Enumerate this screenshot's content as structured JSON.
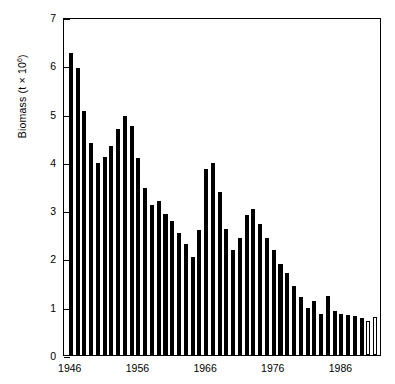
{
  "chart_data": {
    "type": "bar",
    "title": "",
    "subtitle": "",
    "xlabel": "",
    "ylabel": "Biomass (t × 10⁶)",
    "ylabel_base": "Biomass (t × 10",
    "ylabel_exp": "6",
    "ylabel_tail": ")",
    "xlim": [
      1945.0,
      1992.0
    ],
    "ylim": [
      0,
      7
    ],
    "yticks": [
      0,
      1,
      2,
      3,
      4,
      5,
      6,
      7
    ],
    "ytick_labels": [
      "0",
      "1",
      "2",
      "3",
      "4",
      "5",
      "6",
      "7"
    ],
    "xticks": [
      1946,
      1956,
      1966,
      1976,
      1986
    ],
    "xtick_labels": [
      "1946",
      "1956",
      "1966",
      "1976",
      "1986"
    ],
    "grid": false,
    "legend": false,
    "legend_position": "none",
    "bar_color": "#000000",
    "open_bar_fill": "#ffffff",
    "open_bar_edge": "#000000",
    "categories": [
      1946,
      1947,
      1948,
      1949,
      1950,
      1951,
      1952,
      1953,
      1954,
      1955,
      1956,
      1957,
      1958,
      1959,
      1960,
      1961,
      1962,
      1963,
      1964,
      1965,
      1966,
      1967,
      1968,
      1969,
      1970,
      1971,
      1972,
      1973,
      1974,
      1975,
      1976,
      1977,
      1978,
      1979,
      1980,
      1981,
      1982,
      1983,
      1984,
      1985,
      1986,
      1987,
      1988,
      1989,
      1990,
      1991
    ],
    "values": [
      6.25,
      5.95,
      5.05,
      4.4,
      3.98,
      4.1,
      4.33,
      4.68,
      4.95,
      4.75,
      4.08,
      3.45,
      3.1,
      3.18,
      2.92,
      2.78,
      2.52,
      2.3,
      2.02,
      2.58,
      3.85,
      3.98,
      3.38,
      2.6,
      2.18,
      2.42,
      2.9,
      3.02,
      2.72,
      2.42,
      2.18,
      1.88,
      1.7,
      1.43,
      1.2,
      0.98,
      1.12,
      0.85,
      1.22,
      0.92,
      0.85,
      0.82,
      0.8,
      0.76,
      0.7,
      0.78
    ],
    "open_bars": [
      1990,
      1991
    ],
    "series": [
      {
        "name": "Biomass",
        "values": [
          6.25,
          5.95,
          5.05,
          4.4,
          3.98,
          4.1,
          4.33,
          4.68,
          4.95,
          4.75,
          4.08,
          3.45,
          3.1,
          3.18,
          2.92,
          2.78,
          2.52,
          2.3,
          2.02,
          2.58,
          3.85,
          3.98,
          3.38,
          2.6,
          2.18,
          2.42,
          2.9,
          3.02,
          2.72,
          2.42,
          2.18,
          1.88,
          1.7,
          1.43,
          1.2,
          0.98,
          1.12,
          0.85,
          1.22,
          0.92,
          0.85,
          0.82,
          0.8,
          0.76,
          0.7,
          0.78
        ]
      }
    ]
  }
}
